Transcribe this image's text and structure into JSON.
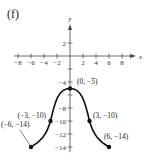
{
  "panel_label": "(f)",
  "chart_data": {
    "type": "line",
    "title": "",
    "xlabel": "x",
    "ylabel": "y",
    "xlim": [
      -8,
      8
    ],
    "ylim": [
      -14,
      2
    ],
    "grid": false,
    "x_ticks": [
      -8,
      -6,
      -4,
      -2,
      2,
      4,
      6,
      8
    ],
    "x_tick_labels": [
      "−8",
      "−6",
      "−4",
      "−2",
      "2",
      "4",
      "6",
      "8"
    ],
    "y_ticks": [
      2,
      -2,
      -4,
      -6,
      -8,
      -10,
      -12,
      -14
    ],
    "y_tick_labels": [
      "2",
      "",
      "−4",
      "",
      "−8",
      "−10",
      "−12",
      "−14"
    ],
    "series": [
      {
        "name": "f",
        "points": [
          {
            "x": -6,
            "y": -14,
            "label": "(−6, −14)"
          },
          {
            "x": -3,
            "y": -10,
            "label": "(−3, −10)"
          },
          {
            "x": 0,
            "y": -5,
            "label": "(0, −5)"
          },
          {
            "x": 3,
            "y": -10,
            "label": "(3, −10)"
          },
          {
            "x": 6,
            "y": -14,
            "label": "(6, −14)"
          }
        ]
      }
    ],
    "annotations": [
      "(0, −5)",
      "(−3, −10)",
      "(3, −10)",
      "(−6, −14)",
      "(6, −14)"
    ]
  }
}
